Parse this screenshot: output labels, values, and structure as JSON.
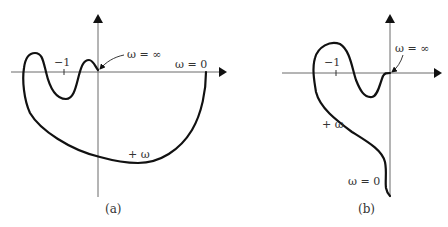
{
  "figure": {
    "panels": [
      {
        "id": "a",
        "caption": "(a)",
        "tick_label": "−1",
        "omega_inf_label": "ω = ∞",
        "omega_zero_label": "ω = 0",
        "plus_omega_label": "+ ω"
      },
      {
        "id": "b",
        "caption": "(b)",
        "tick_label": "−1",
        "omega_inf_label": "ω = ∞",
        "omega_zero_label": "ω = 0",
        "plus_omega_label": "+ ω"
      }
    ]
  },
  "colors": {
    "curve": "#111111",
    "axis": "#6a6a6a",
    "text": "#333333"
  }
}
